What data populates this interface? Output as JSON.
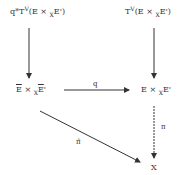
{
  "diagram": {
    "type": "commutative-diagram",
    "nodes": {
      "top_left": {
        "prefix": "q*T",
        "sup": "V",
        "open": "(E × ",
        "sub": "X",
        "rest": "E')"
      },
      "top_right": {
        "prefix": "T",
        "sup": "V",
        "open": "(E × ",
        "sub": "X",
        "rest": "E')"
      },
      "mid_left": {
        "a": "E",
        "times": " × ",
        "sub": "X",
        "b": "E",
        "prime": "'"
      },
      "mid_right": {
        "a": "E × ",
        "sub": "X",
        "b": "E'"
      },
      "bottom_right": {
        "text": "X"
      }
    },
    "arrows": {
      "left_vertical": {
        "label": ""
      },
      "right_vertical": {
        "label": ""
      },
      "horizontal": {
        "label": "q"
      },
      "right_down": {
        "label": "π"
      },
      "diagonal": {
        "label": "π̄"
      }
    }
  }
}
